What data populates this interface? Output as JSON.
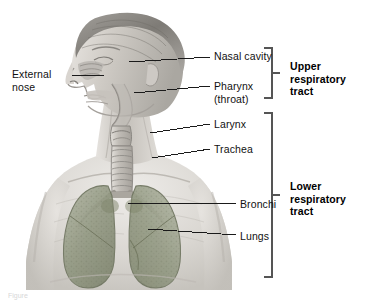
{
  "figure": {
    "background_color": "#ffffff",
    "width": 366,
    "height": 305,
    "caption_fragment": "Figure"
  },
  "illustration": {
    "name": "human-head-and-thorax-cutaway",
    "description": "Grayscale medical illustration of a human head and upper torso in three-quarter left view, showing the nasal cavity, pharynx, larynx, trachea, bronchi and lungs",
    "skin_tone": "#c9c5bf",
    "hair_tone": "#8d8a85",
    "lung_tone": "#9aa08c",
    "airway_tone": "#b6b3ad",
    "outline_color": "#4a4a4a"
  },
  "labels": {
    "left": [
      {
        "id": "external-nose",
        "text": "External\nnose",
        "x": 12,
        "y": 68,
        "leader": {
          "x1": 72,
          "y1": 75,
          "x2": 104,
          "y2": 75
        }
      }
    ],
    "right": [
      {
        "id": "nasal-cavity",
        "text": "Nasal cavity",
        "x": 214,
        "y": 50,
        "leader": {
          "x1": 129,
          "y1": 62,
          "x2": 210,
          "y2": 57
        }
      },
      {
        "id": "pharynx",
        "text": "Pharynx\n(throat)",
        "x": 214,
        "y": 80,
        "leader": {
          "x1": 134,
          "y1": 93,
          "x2": 210,
          "y2": 86
        }
      },
      {
        "id": "larynx",
        "text": "Larynx",
        "x": 214,
        "y": 118,
        "leader": {
          "x1": 150,
          "y1": 133,
          "x2": 210,
          "y2": 124
        }
      },
      {
        "id": "trachea",
        "text": "Trachea",
        "x": 214,
        "y": 143,
        "leader": {
          "x1": 152,
          "y1": 158,
          "x2": 210,
          "y2": 149
        }
      },
      {
        "id": "bronchi",
        "text": "Bronchi",
        "x": 240,
        "y": 198,
        "leader": {
          "x1": 128,
          "y1": 203,
          "x2": 236,
          "y2": 203
        }
      },
      {
        "id": "lungs",
        "text": "Lungs",
        "x": 240,
        "y": 230,
        "leader": {
          "x1": 148,
          "y1": 229,
          "x2": 236,
          "y2": 235
        }
      }
    ]
  },
  "brackets": [
    {
      "id": "upper-respiratory-tract",
      "label": "Upper\nrespiratory\ntract",
      "label_x": 290,
      "label_y": 60,
      "spine_x": 272,
      "y_top": 48,
      "y_bottom": 98,
      "arm_length": 8,
      "tick_y": 73
    },
    {
      "id": "lower-respiratory-tract",
      "label": "Lower\nrespiratory\ntract",
      "label_x": 290,
      "label_y": 180,
      "spine_x": 272,
      "y_top": 113,
      "y_bottom": 277,
      "arm_length": 8,
      "tick_y": 195
    }
  ],
  "colors": {
    "leader_line": "#1a1a1a",
    "bracket_line": "#555555",
    "text": "#111111",
    "bold_text": "#000000"
  }
}
